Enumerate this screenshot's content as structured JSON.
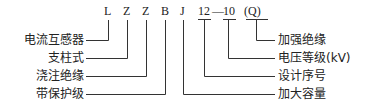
{
  "model_code": {
    "letters": [
      "L",
      "Z",
      "Z",
      "B",
      "J"
    ],
    "serial": "12",
    "dash": "—",
    "voltage": "10",
    "suffix": "(Q)"
  },
  "left_labels": [
    "电流互感器",
    "支柱式",
    "浇注绝缘",
    "带保护级"
  ],
  "right_labels": [
    "加强绝缘",
    "电压等级(kV)",
    "设计序号",
    "加大容量"
  ]
}
